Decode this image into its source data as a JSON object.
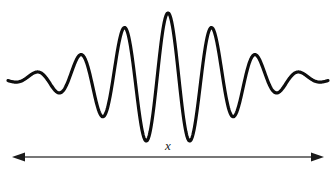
{
  "figure": {
    "background_color": "#ffffff",
    "width": 336,
    "height": 172
  },
  "waveform": {
    "name": "wave-packet-curve",
    "description": "Gaussian-modulated sinusoidal wave packet",
    "stroke_color": "#0d0d0d",
    "stroke_width": 3.2,
    "baseline_y": 79,
    "center_x": 168,
    "amplitude": 66,
    "sigma": 62,
    "wavelength": 44,
    "x_start": 8,
    "x_end": 328,
    "peaks": [
      {
        "x": 46,
        "y": 70
      },
      {
        "x": 90,
        "y": 40
      },
      {
        "x": 134,
        "y": 18
      },
      {
        "x": 177,
        "y": 13
      },
      {
        "x": 221,
        "y": 32
      },
      {
        "x": 265,
        "y": 63
      },
      {
        "x": 308,
        "y": 75
      }
    ],
    "troughs": [
      {
        "x": 68,
        "y": 92
      },
      {
        "x": 112,
        "y": 123
      },
      {
        "x": 156,
        "y": 138
      },
      {
        "x": 199,
        "y": 137
      },
      {
        "x": 243,
        "y": 114
      },
      {
        "x": 287,
        "y": 88
      }
    ]
  },
  "axis": {
    "name": "x-axis-arrow",
    "label": "x",
    "label_x": 168,
    "label_y": 152,
    "line_y": 157,
    "line_x_start": 12,
    "line_x_end": 324,
    "stroke_color": "#4a4a4a",
    "stroke_width": 1.6,
    "arrowhead_color": "#1a1a1a",
    "arrowhead_length": 13,
    "arrowhead_half_width": 4.5,
    "double_headed": true
  }
}
